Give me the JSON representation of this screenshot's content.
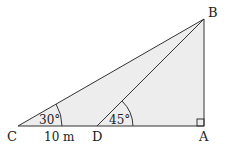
{
  "diagram": {
    "points": {
      "A": {
        "label": "A",
        "x": 204,
        "y": 126
      },
      "B": {
        "label": "B",
        "x": 204,
        "y": 19
      },
      "C": {
        "label": "C",
        "x": 18,
        "y": 126
      },
      "D": {
        "label": "D",
        "x": 97,
        "y": 126
      }
    },
    "angles": {
      "C": "30°",
      "D": "45°"
    },
    "lengths": {
      "CD": "10 m"
    },
    "right_angle_at": "A",
    "fill_color": "#ececec",
    "line_color": "#333333"
  }
}
